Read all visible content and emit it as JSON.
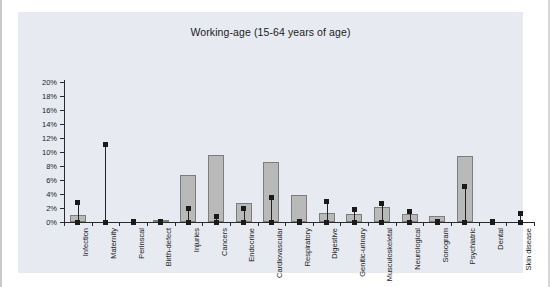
{
  "chart_data": {
    "type": "bar",
    "title": "Working-age (15-64 years of age)",
    "xlabel": "",
    "ylabel": "",
    "ylim": [
      0,
      20
    ],
    "ytick_labels": [
      "0%",
      "2%",
      "4%",
      "6%",
      "8%",
      "10%",
      "12%",
      "14%",
      "16%",
      "18%",
      "20%"
    ],
    "ytick_values": [
      0,
      2,
      4,
      6,
      8,
      10,
      12,
      14,
      16,
      18,
      20
    ],
    "grid": false,
    "legend": "none",
    "categories": [
      "Infection",
      "Maternity",
      "Perinscal",
      "Birth-defect",
      "Injuries",
      "Cancers",
      "Endocrine",
      "Cardiovascular",
      "Respiratory",
      "Digestive",
      "Genitic-urinary",
      "Musculoskeletal",
      "Neurological",
      "Sonogram",
      "Psychiatric",
      "Dental",
      "Skin disease"
    ],
    "series": [
      {
        "name": "bars",
        "type": "bar",
        "values": [
          1.0,
          0.0,
          0.0,
          0.1,
          6.7,
          9.6,
          2.7,
          8.6,
          3.8,
          1.3,
          1.2,
          2.1,
          1.2,
          0.9,
          9.4,
          0.0,
          0.0
        ]
      },
      {
        "name": "markers",
        "type": "scatter",
        "values": [
          2.8,
          11.1,
          0.1,
          0.1,
          1.9,
          0.8,
          2.0,
          3.5,
          0.1,
          3.0,
          1.8,
          2.6,
          1.5,
          0.1,
          5.1,
          0.1,
          1.2
        ]
      }
    ]
  }
}
